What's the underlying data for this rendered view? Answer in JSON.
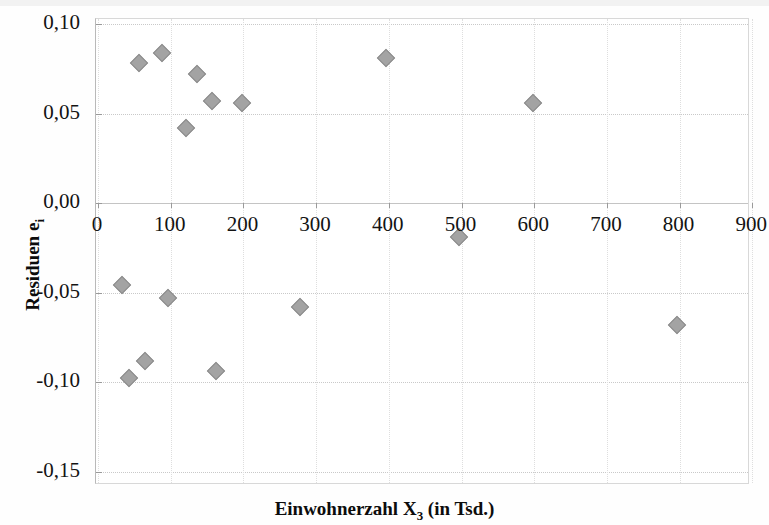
{
  "chart_data": {
    "type": "scatter",
    "title": "",
    "xlabel": "Einwohnerzahl X3 (in Tsd.)",
    "xlabel_main": "Einwohnerzahl X",
    "xlabel_sub": "3",
    "xlabel_tail": " (in Tsd.)",
    "ylabel": "Residuen ei",
    "ylabel_main": "Residuen e",
    "ylabel_sub": "i",
    "xlim": [
      0,
      900
    ],
    "ylim": [
      -0.15,
      0.1
    ],
    "xticks": [
      0,
      100,
      200,
      300,
      400,
      500,
      600,
      700,
      800,
      900
    ],
    "xtick_labels": [
      "0",
      "100",
      "200",
      "300",
      "400",
      "500",
      "600",
      "700",
      "800",
      "900"
    ],
    "yticks": [
      0.1,
      0.05,
      0.0,
      -0.05,
      -0.1,
      -0.15
    ],
    "ytick_labels": [
      "0,10",
      "0,05",
      "0,00",
      "-0,05",
      "-0,10",
      "-0,15"
    ],
    "grid": true,
    "grid_axis": "both",
    "legend": "none",
    "marker_shape": "diamond",
    "marker_color": "#a3a3a3",
    "marker_edge_color": "#8c8c8c",
    "points": [
      {
        "x": 33,
        "y": -0.046
      },
      {
        "x": 43,
        "y": -0.098
      },
      {
        "x": 56,
        "y": 0.078
      },
      {
        "x": 65,
        "y": -0.088
      },
      {
        "x": 88,
        "y": 0.084
      },
      {
        "x": 96,
        "y": -0.053
      },
      {
        "x": 121,
        "y": 0.042
      },
      {
        "x": 136,
        "y": 0.072
      },
      {
        "x": 157,
        "y": 0.057
      },
      {
        "x": 162,
        "y": -0.094
      },
      {
        "x": 198,
        "y": 0.056
      },
      {
        "x": 278,
        "y": -0.058
      },
      {
        "x": 396,
        "y": 0.081
      },
      {
        "x": 497,
        "y": -0.019
      },
      {
        "x": 598,
        "y": 0.056
      },
      {
        "x": 796,
        "y": -0.068
      }
    ]
  }
}
